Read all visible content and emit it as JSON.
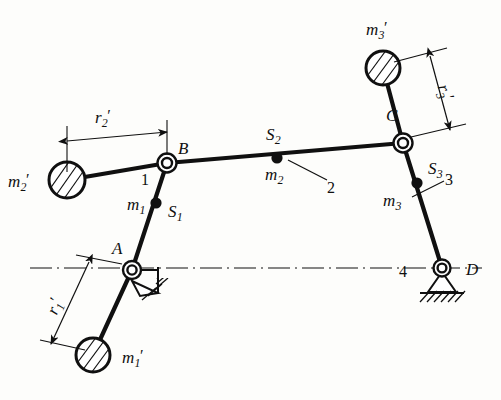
{
  "figure": {
    "type": "mechanism-diagram",
    "background_color": "#fdfdfb",
    "line_color": "#101010"
  },
  "points": {
    "A": {
      "label": "A",
      "x": 132,
      "y": 270,
      "joint": "fixed-pivot"
    },
    "B": {
      "label": "B",
      "x": 167,
      "y": 163,
      "joint": "pin"
    },
    "C": {
      "label": "C",
      "x": 403,
      "y": 143,
      "joint": "pin"
    },
    "D": {
      "label": "D",
      "x": 442,
      "y": 268,
      "joint": "fixed-pivot"
    }
  },
  "links": [
    {
      "number": "1",
      "label_x": 146,
      "label_y": 180,
      "name": "crank"
    },
    {
      "number": "2",
      "label_x": 331,
      "label_y": 186,
      "name": "coupler"
    },
    {
      "number": "3",
      "label_x": 449,
      "label_y": 186,
      "name": "rocker"
    },
    {
      "number": "4",
      "label_x": 404,
      "label_y": 272,
      "name": "frame"
    }
  ],
  "centers_of_mass": [
    {
      "point_label": "S",
      "point_sub": "1",
      "mass_label": "m",
      "mass_sub": "1",
      "x": 156,
      "y": 203
    },
    {
      "point_label": "S",
      "point_sub": "2",
      "mass_label": "m",
      "mass_sub": "2",
      "x": 277,
      "y": 158
    },
    {
      "point_label": "S",
      "point_sub": "3",
      "mass_label": "m",
      "mass_sub": "3",
      "x": 417,
      "y": 183
    }
  ],
  "counterweights": [
    {
      "label": "m",
      "sub": "1",
      "prime": "′",
      "cx": 93,
      "cy": 355,
      "r": 17
    },
    {
      "label": "m",
      "sub": "2",
      "prime": "′",
      "cx": 67,
      "cy": 180,
      "r": 18
    },
    {
      "label": "m",
      "sub": "3",
      "prime": "′",
      "cx": 383,
      "cy": 68,
      "r": 17
    }
  ],
  "dimensions": [
    {
      "label": "r",
      "sub": "1",
      "prime": "′",
      "label_x": 58,
      "label_y": 305,
      "orientation": "rotated"
    },
    {
      "label": "r",
      "sub": "2",
      "prime": "′",
      "label_x": 103,
      "label_y": 122,
      "orientation": "horizontal"
    },
    {
      "label": "r",
      "sub": "3",
      "prime": "′",
      "label_x": 444,
      "label_y": 92,
      "orientation": "rotated"
    }
  ],
  "labels": {
    "point_A": "A",
    "point_B": "B",
    "point_C": "C",
    "point_D": "D",
    "link_1": "1",
    "link_2": "2",
    "link_3": "3",
    "link_4": "4",
    "S1": "S",
    "S1_sub": "1",
    "S2": "S",
    "S2_sub": "2",
    "S3": "S",
    "S3_sub": "3",
    "m1": "m",
    "m1_sub": "1",
    "m2": "m",
    "m2_sub": "2",
    "m3": "m",
    "m3_sub": "3",
    "m1p": "m",
    "m1p_sub": "1",
    "m1p_prime": "′",
    "m2p": "m",
    "m2p_sub": "2",
    "m2p_prime": "′",
    "m3p": "m",
    "m3p_sub": "3",
    "m3p_prime": "′",
    "r1p": "r",
    "r1p_sub": "1",
    "r1p_prime": "′",
    "r2p": "r",
    "r2p_sub": "2",
    "r2p_prime": "′",
    "r3p": "r",
    "r3p_sub": "3",
    "r3p_prime": "′"
  },
  "centerline": {
    "y": 268,
    "x_start": 30,
    "x_end": 482,
    "style": "dash-dot"
  }
}
